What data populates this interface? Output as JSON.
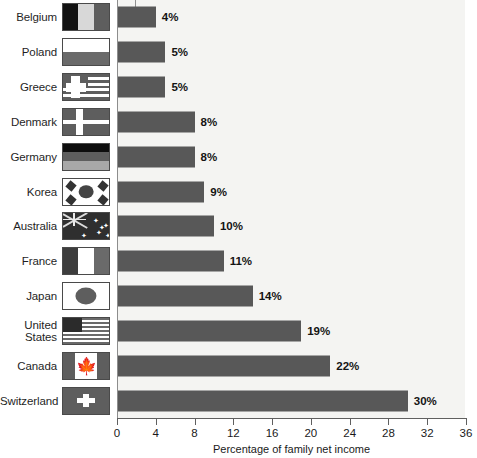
{
  "chart_data": {
    "type": "bar",
    "orientation": "horizontal",
    "title": "",
    "xlabel": "Percentage of family net income",
    "ylabel": "",
    "xlim": [
      0,
      36
    ],
    "xticks": [
      0,
      4,
      8,
      12,
      16,
      20,
      24,
      28,
      32,
      36
    ],
    "grid": false,
    "legend": "none",
    "categories": [
      "Belgium",
      "Poland",
      "Greece",
      "Denmark",
      "Germany",
      "Korea",
      "Australia",
      "France",
      "Japan",
      "United States",
      "Canada",
      "Switzerland"
    ],
    "values": [
      4,
      5,
      5,
      8,
      8,
      9,
      10,
      11,
      14,
      19,
      22,
      30
    ],
    "value_labels": [
      "4%",
      "5%",
      "5%",
      "8%",
      "8%",
      "9%",
      "10%",
      "11%",
      "14%",
      "19%",
      "22%",
      "30%"
    ],
    "bar_color": "#585858",
    "plot_background": "#f4f4f2"
  },
  "axis": {
    "x_title": "Percentage of family net income",
    "ticks": [
      "0",
      "4",
      "8",
      "12",
      "16",
      "20",
      "24",
      "28",
      "32",
      "36"
    ]
  },
  "rows": [
    {
      "country": "Belgium",
      "value": 4,
      "label": "4%",
      "flag": "flag-belgium"
    },
    {
      "country": "Poland",
      "value": 5,
      "label": "5%",
      "flag": "flag-poland"
    },
    {
      "country": "Greece",
      "value": 5,
      "label": "5%",
      "flag": "flag-greece"
    },
    {
      "country": "Denmark",
      "value": 8,
      "label": "8%",
      "flag": "flag-denmark"
    },
    {
      "country": "Germany",
      "value": 8,
      "label": "8%",
      "flag": "flag-germany"
    },
    {
      "country": "Korea",
      "value": 9,
      "label": "9%",
      "flag": "flag-korea"
    },
    {
      "country": "Australia",
      "value": 10,
      "label": "10%",
      "flag": "flag-australia"
    },
    {
      "country": "France",
      "value": 11,
      "label": "11%",
      "flag": "flag-france"
    },
    {
      "country": "Japan",
      "value": 14,
      "label": "14%",
      "flag": "flag-japan"
    },
    {
      "country": "United States",
      "value": 19,
      "label": "19%",
      "flag": "flag-united-states"
    },
    {
      "country": "Canada",
      "value": 22,
      "label": "22%",
      "flag": "flag-canada"
    },
    {
      "country": "Switzerland",
      "value": 30,
      "label": "30%",
      "flag": "flag-switzerland"
    }
  ]
}
